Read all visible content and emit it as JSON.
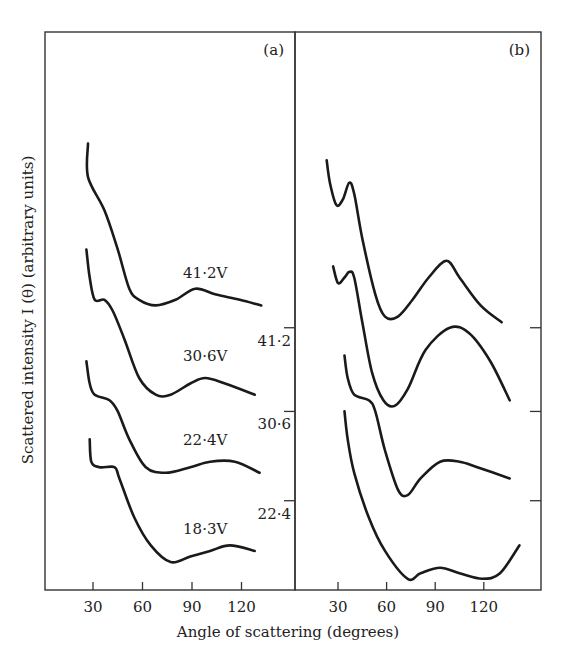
{
  "chart_data": {
    "type": "line",
    "xlabel": "Angle of scattering (degrees)",
    "ylabel": "Scattered intensity  I (θ) (arbitrary units)",
    "panels": [
      {
        "id": "a",
        "label": "(a)",
        "xlim": [
          15,
          150
        ],
        "ylim": [
          0,
          100
        ],
        "xticks": [
          30,
          60,
          90,
          120
        ],
        "xtick_labels": [
          "30",
          "60",
          "90",
          "120"
        ],
        "series": [
          {
            "name": "41·2V",
            "label_at": [
              98,
              56
            ],
            "points": [
              [
                27,
                80
              ],
              [
                27,
                74
              ],
              [
                37,
                68
              ],
              [
                45,
                61
              ],
              [
                52,
                54
              ],
              [
                58,
                52
              ],
              [
                68,
                51
              ],
              [
                80,
                52
              ],
              [
                92,
                54
              ],
              [
                104,
                53
              ],
              [
                119,
                52
              ],
              [
                132,
                51
              ]
            ]
          },
          {
            "name": "30·6V",
            "label_at": [
              98,
              41
            ],
            "points": [
              [
                26,
                61
              ],
              [
                28,
                56
              ],
              [
                31,
                52
              ],
              [
                37,
                52
              ],
              [
                42,
                50
              ],
              [
                49,
                45
              ],
              [
                58,
                38
              ],
              [
                68,
                35
              ],
              [
                77,
                35
              ],
              [
                89,
                37
              ],
              [
                98,
                38
              ],
              [
                110,
                37
              ],
              [
                128,
                35
              ]
            ]
          },
          {
            "name": "22·4V",
            "label_at": [
              98,
              26
            ],
            "points": [
              [
                26,
                41
              ],
              [
                28,
                37
              ],
              [
                31,
                35
              ],
              [
                40,
                34
              ],
              [
                45,
                32
              ],
              [
                52,
                27
              ],
              [
                62,
                22
              ],
              [
                74,
                21
              ],
              [
                89,
                22
              ],
              [
                101,
                23
              ],
              [
                116,
                23
              ],
              [
                131,
                21
              ]
            ]
          },
          {
            "name": "18·3V",
            "label_at": [
              98,
              10
            ],
            "points": [
              [
                28,
                27
              ],
              [
                29,
                23
              ],
              [
                34,
                22
              ],
              [
                43,
                22
              ],
              [
                46,
                20
              ],
              [
                55,
                13
              ],
              [
                65,
                8
              ],
              [
                77,
                5
              ],
              [
                89,
                6
              ],
              [
                101,
                7
              ],
              [
                113,
                8
              ],
              [
                128,
                7
              ]
            ]
          }
        ]
      },
      {
        "id": "b",
        "label": "(b)",
        "xlim": [
          7,
          157
        ],
        "ylim": [
          0,
          100
        ],
        "xticks": [
          30,
          60,
          90,
          120
        ],
        "xtick_labels": [
          "30",
          "60",
          "90",
          "120"
        ],
        "offset_ticks": [
          {
            "label": "41·2",
            "value": 47
          },
          {
            "label": "30·6",
            "value": 32
          },
          {
            "label": "22·4",
            "value": 16
          }
        ],
        "series": [
          {
            "name": "41·2V",
            "points": [
              [
                23,
                77
              ],
              [
                25,
                73
              ],
              [
                29,
                69
              ],
              [
                33,
                70
              ],
              [
                37,
                73
              ],
              [
                40,
                71
              ],
              [
                45,
                63
              ],
              [
                53,
                53
              ],
              [
                59,
                49
              ],
              [
                67,
                49
              ],
              [
                76,
                52
              ],
              [
                86,
                56
              ],
              [
                97,
                59
              ],
              [
                105,
                56
              ],
              [
                118,
                51
              ],
              [
                131,
                48
              ]
            ]
          },
          {
            "name": "30·6V",
            "points": [
              [
                27,
                58
              ],
              [
                30,
                55
              ],
              [
                34,
                56
              ],
              [
                37,
                57
              ],
              [
                40,
                56
              ],
              [
                45,
                48
              ],
              [
                51,
                39
              ],
              [
                58,
                34
              ],
              [
                65,
                33
              ],
              [
                73,
                36
              ],
              [
                84,
                43
              ],
              [
                99,
                47
              ],
              [
                111,
                46
              ],
              [
                124,
                41
              ],
              [
                136,
                34
              ]
            ]
          },
          {
            "name": "22·4V",
            "points": [
              [
                34,
                42
              ],
              [
                36,
                38
              ],
              [
                40,
                35
              ],
              [
                49,
                34
              ],
              [
                53,
                32
              ],
              [
                59,
                25
              ],
              [
                67,
                18
              ],
              [
                73,
                17
              ],
              [
                81,
                20
              ],
              [
                93,
                23
              ],
              [
                105,
                23
              ],
              [
                116,
                22
              ],
              [
                136,
                20
              ]
            ]
          },
          {
            "name": "18·3V",
            "points": [
              [
                34,
                32
              ],
              [
                36,
                27
              ],
              [
                40,
                21
              ],
              [
                49,
                13
              ],
              [
                59,
                7
              ],
              [
                73,
                2
              ],
              [
                81,
                3
              ],
              [
                93,
                4
              ],
              [
                105,
                3
              ],
              [
                119,
                2
              ],
              [
                130,
                3
              ],
              [
                142,
                8
              ]
            ]
          }
        ]
      }
    ],
    "grid": false,
    "legend": "none (inline curve labels)"
  }
}
